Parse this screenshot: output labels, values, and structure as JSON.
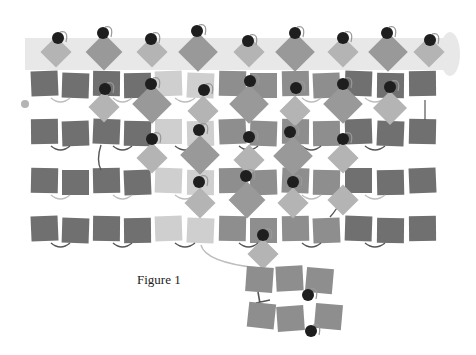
{
  "figure": {
    "caption": "Figure 1",
    "colors": {
      "band": "#e8e8e8",
      "dark_square": "#707070",
      "mid_square": "#8e8e8e",
      "light_square": "#cfcfcf",
      "diamond_light": "#b4b4b4",
      "diamond_mid": "#999999",
      "dot": "#1e1e1e",
      "link": "#555555",
      "link_light": "#bdbdbd"
    },
    "band": {
      "x": 25,
      "y": 38,
      "w": 425,
      "h": 32
    },
    "rows": [
      {
        "y": 72,
        "squares": [
          "d",
          "d",
          "d",
          "d",
          "l",
          "l",
          "m",
          "m",
          "m",
          "m",
          "d",
          "d",
          "d"
        ]
      },
      {
        "y": 120,
        "squares": [
          "d",
          "d",
          "d",
          "d",
          "l",
          "l",
          "m",
          "m",
          "m",
          "m",
          "d",
          "d",
          "d"
        ]
      },
      {
        "y": 169,
        "squares": [
          "d",
          "d",
          "d",
          "d",
          "l",
          "l",
          "m",
          "m",
          "m",
          "m",
          "d",
          "d",
          "d"
        ]
      },
      {
        "y": 217,
        "squares": [
          "d",
          "d",
          "d",
          "d",
          "l",
          "l",
          "m",
          "m",
          "m",
          "m",
          "d",
          "d",
          "d"
        ]
      }
    ],
    "column_x": [
      31,
      62,
      93,
      124,
      155,
      187,
      219,
      250,
      282,
      313,
      345,
      377,
      409
    ],
    "top_diamonds": [
      {
        "x": 56,
        "size": 22,
        "tone": "light"
      },
      {
        "x": 104,
        "size": 26,
        "tone": "mid"
      },
      {
        "x": 152,
        "size": 22,
        "tone": "light"
      },
      {
        "x": 198,
        "size": 28,
        "tone": "mid"
      },
      {
        "x": 249,
        "size": 22,
        "tone": "light"
      },
      {
        "x": 295,
        "size": 28,
        "tone": "mid"
      },
      {
        "x": 343,
        "size": 22,
        "tone": "light"
      },
      {
        "x": 388,
        "size": 28,
        "tone": "mid"
      },
      {
        "x": 429,
        "size": 22,
        "tone": "light"
      }
    ],
    "top_dots": [
      {
        "x": 58,
        "y": 38
      },
      {
        "x": 103,
        "y": 33
      },
      {
        "x": 151,
        "y": 39
      },
      {
        "x": 197,
        "y": 31
      },
      {
        "x": 248,
        "y": 41
      },
      {
        "x": 295,
        "y": 33
      },
      {
        "x": 343,
        "y": 38
      },
      {
        "x": 387,
        "y": 33
      },
      {
        "x": 430,
        "y": 40
      }
    ],
    "mid_diamonds": [
      {
        "x": 104,
        "y": 107,
        "size": 22,
        "tone": "light"
      },
      {
        "x": 152,
        "y": 104,
        "size": 28,
        "tone": "mid"
      },
      {
        "x": 203,
        "y": 111,
        "size": 22,
        "tone": "light"
      },
      {
        "x": 249,
        "y": 104,
        "size": 28,
        "tone": "mid"
      },
      {
        "x": 295,
        "y": 111,
        "size": 22,
        "tone": "light"
      },
      {
        "x": 343,
        "y": 104,
        "size": 28,
        "tone": "mid"
      },
      {
        "x": 390,
        "y": 108,
        "size": 24,
        "tone": "light"
      },
      {
        "x": 152,
        "y": 158,
        "size": 22,
        "tone": "light"
      },
      {
        "x": 200,
        "y": 155,
        "size": 28,
        "tone": "mid"
      },
      {
        "x": 249,
        "y": 160,
        "size": 22,
        "tone": "light"
      },
      {
        "x": 293,
        "y": 156,
        "size": 28,
        "tone": "mid"
      },
      {
        "x": 343,
        "y": 158,
        "size": 22,
        "tone": "light"
      },
      {
        "x": 200,
        "y": 203,
        "size": 22,
        "tone": "light"
      },
      {
        "x": 247,
        "y": 200,
        "size": 26,
        "tone": "mid"
      },
      {
        "x": 293,
        "y": 203,
        "size": 22,
        "tone": "light"
      },
      {
        "x": 343,
        "y": 200,
        "size": 22,
        "tone": "light"
      },
      {
        "x": 263,
        "y": 254,
        "size": 22,
        "tone": "light"
      }
    ],
    "mid_dots": [
      {
        "x": 105,
        "y": 89
      },
      {
        "x": 151,
        "y": 84
      },
      {
        "x": 204,
        "y": 90
      },
      {
        "x": 250,
        "y": 81
      },
      {
        "x": 296,
        "y": 88
      },
      {
        "x": 343,
        "y": 84
      },
      {
        "x": 390,
        "y": 87
      },
      {
        "x": 152,
        "y": 139
      },
      {
        "x": 199,
        "y": 130
      },
      {
        "x": 249,
        "y": 137
      },
      {
        "x": 290,
        "y": 132
      },
      {
        "x": 343,
        "y": 139
      },
      {
        "x": 199,
        "y": 182
      },
      {
        "x": 246,
        "y": 176
      },
      {
        "x": 293,
        "y": 182
      },
      {
        "x": 263,
        "y": 235
      },
      {
        "x": 308,
        "y": 295
      },
      {
        "x": 311,
        "y": 331
      }
    ],
    "bottom_cluster": [
      {
        "x": 246,
        "y": 267,
        "rot": 4
      },
      {
        "x": 276,
        "y": 266,
        "rot": -3
      },
      {
        "x": 306,
        "y": 268,
        "rot": 5
      },
      {
        "x": 248,
        "y": 303,
        "rot": 6
      },
      {
        "x": 277,
        "y": 306,
        "rot": -4
      },
      {
        "x": 315,
        "y": 304,
        "rot": 5
      }
    ]
  }
}
